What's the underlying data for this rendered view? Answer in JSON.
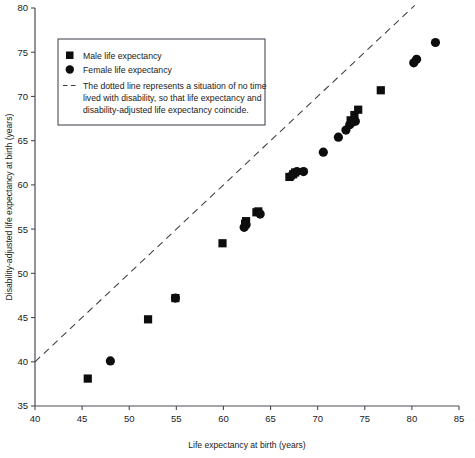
{
  "chart_data": {
    "type": "scatter",
    "title": "",
    "xlabel": "Life expectancy at birth (years)",
    "ylabel": "Disability-adjusted life expectancy at birth (years)",
    "xlim": [
      40,
      85
    ],
    "ylim": [
      35,
      80
    ],
    "xticks": [
      40,
      45,
      50,
      55,
      60,
      65,
      70,
      75,
      80,
      85
    ],
    "yticks": [
      35,
      40,
      45,
      50,
      55,
      60,
      65,
      70,
      75,
      80
    ],
    "grid": false,
    "legend_position": "upper-left",
    "series": [
      {
        "name": "Male life expectancy",
        "marker": "square",
        "color": "#0d0d0d",
        "points": [
          {
            "x": 45.6,
            "y": 38.1
          },
          {
            "x": 52.0,
            "y": 44.8
          },
          {
            "x": 54.9,
            "y": 47.2
          },
          {
            "x": 59.9,
            "y": 53.4
          },
          {
            "x": 62.3,
            "y": 55.6
          },
          {
            "x": 62.4,
            "y": 55.9
          },
          {
            "x": 63.5,
            "y": 56.9
          },
          {
            "x": 63.7,
            "y": 57.0
          },
          {
            "x": 67.0,
            "y": 60.9
          },
          {
            "x": 67.4,
            "y": 61.2
          },
          {
            "x": 67.6,
            "y": 61.4
          },
          {
            "x": 73.5,
            "y": 67.3
          },
          {
            "x": 73.9,
            "y": 67.9
          },
          {
            "x": 74.3,
            "y": 68.5
          },
          {
            "x": 76.7,
            "y": 70.7
          }
        ]
      },
      {
        "name": "Female life expectancy",
        "marker": "circle",
        "color": "#0d0d0d",
        "points": [
          {
            "x": 48.0,
            "y": 40.1
          },
          {
            "x": 54.9,
            "y": 47.2
          },
          {
            "x": 62.2,
            "y": 55.2
          },
          {
            "x": 62.4,
            "y": 55.5
          },
          {
            "x": 63.9,
            "y": 56.7
          },
          {
            "x": 67.2,
            "y": 61.0
          },
          {
            "x": 67.8,
            "y": 61.5
          },
          {
            "x": 68.5,
            "y": 61.5
          },
          {
            "x": 70.6,
            "y": 63.7
          },
          {
            "x": 72.2,
            "y": 65.4
          },
          {
            "x": 73.0,
            "y": 66.2
          },
          {
            "x": 73.4,
            "y": 66.8
          },
          {
            "x": 73.7,
            "y": 67.1
          },
          {
            "x": 74.0,
            "y": 67.2
          },
          {
            "x": 80.2,
            "y": 73.8
          },
          {
            "x": 80.5,
            "y": 74.2
          },
          {
            "x": 82.5,
            "y": 76.1
          }
        ]
      }
    ],
    "reference_line": {
      "name": "identity-line",
      "style": "dashed",
      "from": {
        "x": 40,
        "y": 40
      },
      "to": {
        "x": 80.3,
        "y": 80.3
      }
    },
    "annotations": []
  },
  "legend": {
    "entries": [
      {
        "marker": "square",
        "label": "Male life expectancy"
      },
      {
        "marker": "circle",
        "label": "Female life expectancy"
      }
    ],
    "note_lines": [
      "The dotted line represents a situation of no time",
      "lived with disability, so that life expectancy and",
      "disability-adjusted life expectancy coincide."
    ]
  },
  "colors": {
    "marker": "#0d0d0d",
    "axis": "#4a4a55",
    "background": "#ffffff"
  }
}
